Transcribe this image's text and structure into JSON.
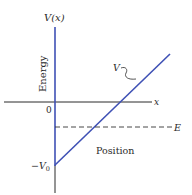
{
  "diagram": {
    "y_axis_label": "V(x)",
    "y_axis_title": "Energy",
    "x_axis_label": "x",
    "x_axis_title": "Position",
    "origin_label": "0",
    "min_label": "−V",
    "min_label_sub": "0",
    "potential_label": "V",
    "energy_label": "E",
    "colors": {
      "potential": "#3f51b5",
      "axes": "#2a2a2a",
      "energy_line": "#333333"
    }
  }
}
